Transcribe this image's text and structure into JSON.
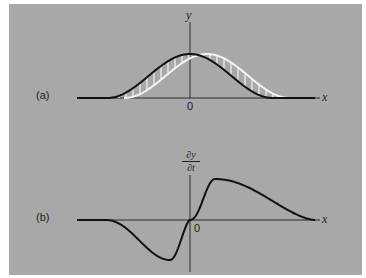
{
  "figure": {
    "background_color": "#a8a8a8",
    "page_color": "#ffffff",
    "curve_color": "#111111",
    "shifted_curve_color": "#f4f4f4",
    "axis_color": "#2a2a2a",
    "panel_a": {
      "label": "(a)",
      "y_axis_label": "y",
      "x_axis_label": "x",
      "origin_label": "0",
      "description": "Pulse y(x) at time t (black) and slightly later (white, shifted right); vertical hatching marks the change between them",
      "pulse_center": 190,
      "pulse_half_width": 83,
      "pulse_height": 44,
      "shift": 17,
      "baseline_y": 98,
      "axis_x_start": 77,
      "axis_x_end": 320,
      "y_axis_top": 22,
      "hatch_spacing": 7
    },
    "panel_b": {
      "label": "(b)",
      "y_axis_label_num": "∂y",
      "y_axis_label_den": "∂t",
      "x_axis_label": "x",
      "origin_label": "0",
      "description": "Transverse velocity ∂y/∂t of the pulse vs x: negative lobe left of origin, positive lobe right of origin",
      "baseline_y": 220,
      "axis_x_start": 77,
      "axis_x_end": 320,
      "y_axis_top": 175,
      "y_axis_bottom": 272,
      "min_point": [
        170,
        260
      ],
      "max_point": [
        215,
        179
      ],
      "left_flat_end": 105,
      "right_flat_start": 315
    }
  }
}
